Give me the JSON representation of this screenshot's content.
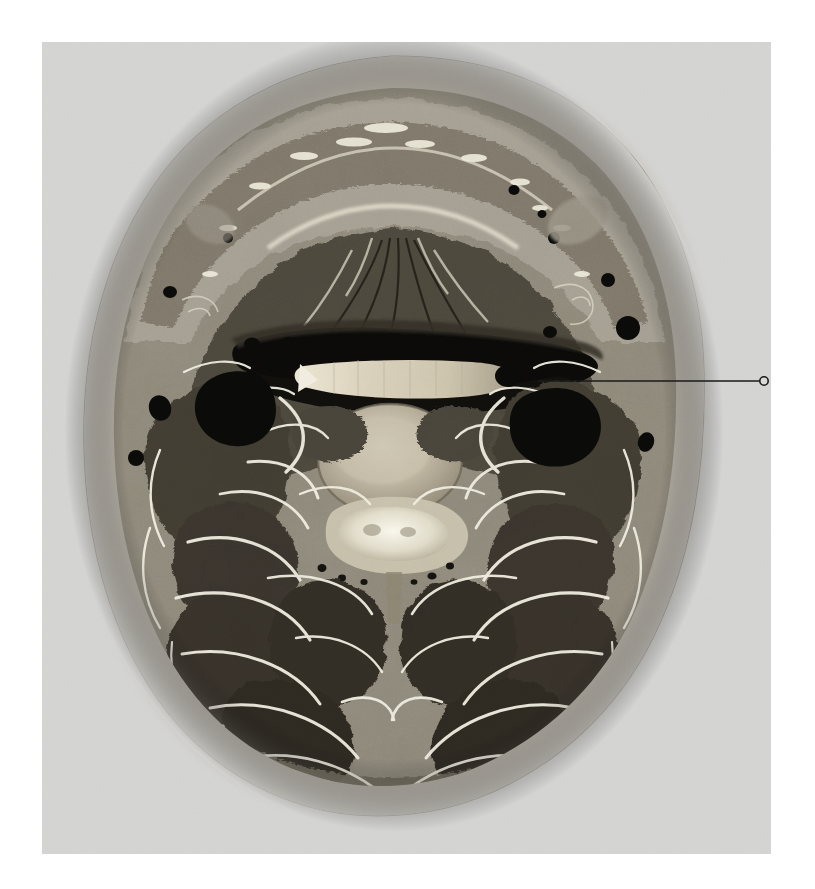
{
  "page": {
    "width": 815,
    "height": 889,
    "background_color": "#ffffff",
    "title": "Axial cross-section of the neck"
  },
  "plate": {
    "name": "anatomical-plate",
    "x": 42,
    "y": 42,
    "width": 729,
    "height": 812,
    "background_color": "#d5d5d4",
    "paper_tone": "#d7d7d6",
    "description": "Photographic transverse (axial) anatomical section through the neck at the level of a cervical vertebra, mounted on a plain grey background."
  },
  "specimen": {
    "name": "neck-cross-section",
    "center_x": 392,
    "center_y": 450,
    "radius_x": 278,
    "radius_y": 395,
    "outline_color": "#b9b6ae",
    "skin_color": "#c2beb4",
    "fat_color": "#a9a49a",
    "muscle_color": "#565046",
    "muscle_dark_color": "#3a352d",
    "fascia_color": "#f2efe6",
    "airway_color": "#0d0c0a",
    "vessel_color": "#0a0a09",
    "bone_color": "#b5aa95",
    "cord_color": "#f4f1e4",
    "orientation": "anterior at top, posterior at bottom"
  },
  "structures": [
    {
      "name": "skin-and-subcutaneous-fat",
      "region": "outer-rim",
      "tone": "light"
    },
    {
      "name": "platysma-and-superficial-fascia",
      "region": "anterior-rim",
      "tone": "light"
    },
    {
      "name": "tongue-base-musculature",
      "region": "anterior-midline",
      "tone": "mid"
    },
    {
      "name": "genioglossus-fan",
      "region": "anterior-midline",
      "tone": "mid-dark"
    },
    {
      "name": "oropharynx-airway",
      "region": "central-upper",
      "tone": "black"
    },
    {
      "name": "soft-palate-uvula-shelf",
      "region": "central",
      "tone": "bright"
    },
    {
      "name": "vertebral-body",
      "region": "central",
      "tone": "bright"
    },
    {
      "name": "spinal-canal-and-cord",
      "region": "central-lower",
      "tone": "brightest"
    },
    {
      "name": "vertebral-lamina-and-spinous-process",
      "region": "posterior-midline",
      "tone": "mid"
    },
    {
      "name": "carotid-sheath-left",
      "region": "left-paramedian",
      "tone": "black"
    },
    {
      "name": "carotid-sheath-right",
      "region": "right-paramedian",
      "tone": "black"
    },
    {
      "name": "internal-jugular-vein-right",
      "region": "right-paramedian",
      "tone": "black"
    },
    {
      "name": "external-jugular-vein-left",
      "region": "left-lateral",
      "tone": "black"
    },
    {
      "name": "sternocleidomastoid-left",
      "region": "left-lateral",
      "tone": "mid-dark"
    },
    {
      "name": "sternocleidomastoid-right",
      "region": "right-lateral",
      "tone": "mid-dark"
    },
    {
      "name": "levator-scapulae",
      "region": "posterolateral",
      "tone": "dark"
    },
    {
      "name": "splenius-capitis",
      "region": "posterior",
      "tone": "dark"
    },
    {
      "name": "semispinalis-capitis",
      "region": "posterior-midline",
      "tone": "dark"
    },
    {
      "name": "trapezius",
      "region": "posterior-rim",
      "tone": "mid"
    },
    {
      "name": "nuchal-ligament",
      "region": "posterior-midline",
      "tone": "bright"
    }
  ],
  "annotation": {
    "name": "leader-annotation",
    "label": "",
    "line": {
      "x1": 538,
      "y1": 381,
      "x2": 759,
      "y2": 381,
      "color": "#1a1a1a",
      "width": 1.6
    },
    "marker": {
      "shape": "circle",
      "cx": 764,
      "cy": 381,
      "r": 4.2,
      "stroke": "#1a1a1a",
      "fill": "#d5d5d4"
    },
    "points_to": "carotid-sheath-right"
  },
  "artifacts": {
    "name": "paper-bleed-through",
    "description": "Very faint show-through of a printed letterform in the upper-left grey margin",
    "x": 150,
    "y": 160,
    "width": 140,
    "height": 130,
    "opacity": 0.05
  }
}
